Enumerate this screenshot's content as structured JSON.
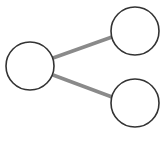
{
  "icon": {
    "name": "share-icon",
    "colors": {
      "background": "#ffffff",
      "node_stroke": "#333333",
      "node_fill": "#ffffff",
      "edge_stroke": "#8a8a8a"
    },
    "nodes": [
      {
        "id": "left",
        "cx": 30,
        "cy": 66,
        "r": 24
      },
      {
        "id": "top-right",
        "cx": 135,
        "cy": 31,
        "r": 24
      },
      {
        "id": "bottom-right",
        "cx": 135,
        "cy": 103,
        "r": 24
      }
    ],
    "edges": [
      {
        "from": "left",
        "to": "top-right",
        "x1": 53,
        "y1": 58,
        "x2": 112,
        "y2": 37
      },
      {
        "from": "left",
        "to": "bottom-right",
        "x1": 53,
        "y1": 75,
        "x2": 112,
        "y2": 97
      }
    ]
  }
}
